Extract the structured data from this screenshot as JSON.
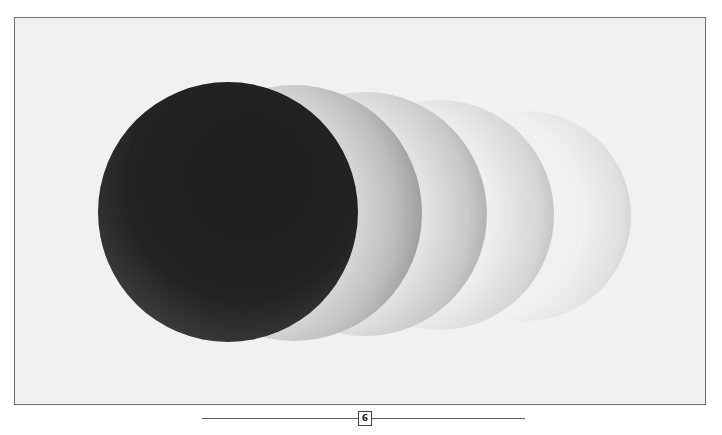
{
  "page": {
    "page_number": "6",
    "background_color": "#ffffff",
    "frame_color": "#6e6e6e",
    "paper_color": "#f1f1f0"
  },
  "illustration": {
    "description": "One dark sphere followed by four progressively fainter, smaller light spheres receding to the right",
    "dark_sphere": {
      "cx": 227,
      "cy": 211,
      "r": 130,
      "color": "#232222",
      "highlight_color": "#4a4949"
    },
    "ghost_spheres": [
      {
        "right_edge": 421,
        "cy": 212,
        "r": 128,
        "shade": "#8f8f8f",
        "opacity": 0.95
      },
      {
        "right_edge": 486,
        "cy": 213,
        "r": 122,
        "shade": "#9c9c9c",
        "opacity": 0.8
      },
      {
        "right_edge": 553,
        "cy": 214,
        "r": 115,
        "shade": "#b0b0b0",
        "opacity": 0.6
      },
      {
        "right_edge": 630,
        "cy": 215,
        "r": 105,
        "shade": "#cccccc",
        "opacity": 0.45
      }
    ]
  }
}
